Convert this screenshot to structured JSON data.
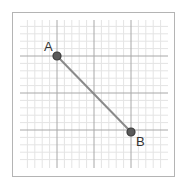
{
  "diagram": {
    "type": "coordinate-grid-segment",
    "grid": {
      "x_start": 20,
      "x_end": 168,
      "y_start": 20,
      "y_end": 168,
      "minor_spacing": 7.4,
      "major_every": 5,
      "major_positions": [
        57,
        94,
        131
      ],
      "minor_color": "#e4e4e4",
      "major_color": "#a8a8a8"
    },
    "points": [
      {
        "label": "A",
        "x": 57,
        "y": 56
      },
      {
        "label": "B",
        "x": 131,
        "y": 132
      }
    ],
    "segment": {
      "from": "A",
      "to": "B",
      "color": "#8a8a8a"
    },
    "point_fill": "#5a5a5a",
    "point_stroke": "#3a3a3a"
  }
}
